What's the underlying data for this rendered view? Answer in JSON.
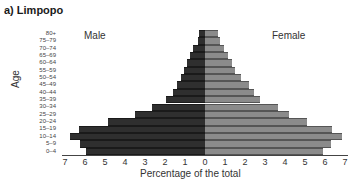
{
  "chart_data": {
    "type": "bar",
    "subtype": "population-pyramid",
    "title": "a) Limpopo",
    "xlabel": "Percentage of the total",
    "ylabel": "Age",
    "xlim": [
      -7,
      7
    ],
    "xticks": [
      "7",
      "6",
      "5",
      "4",
      "3",
      "2",
      "1",
      "0",
      "1",
      "2",
      "3",
      "4",
      "5",
      "6",
      "7"
    ],
    "grid": false,
    "legend": "inline side labels (Male left, Female right)",
    "categories": [
      "80+",
      "75–79",
      "70–74",
      "65–69",
      "60–64",
      "55–59",
      "50–54",
      "45–49",
      "40–44",
      "35–39",
      "30–34",
      "25–29",
      "20–24",
      "15–19",
      "10–14",
      "5–9",
      "0–4"
    ],
    "series": [
      {
        "name": "Male",
        "color": "#2f2f2f",
        "values": [
          0.3,
          0.35,
          0.6,
          0.75,
          0.9,
          1.05,
          1.2,
          1.4,
          1.6,
          1.95,
          2.65,
          3.5,
          4.85,
          6.3,
          6.75,
          6.25,
          5.95
        ]
      },
      {
        "name": "Female",
        "color": "#8b8b8b",
        "values": [
          0.65,
          0.75,
          0.95,
          1.15,
          1.35,
          1.5,
          1.8,
          2.2,
          2.45,
          2.75,
          3.65,
          4.2,
          5.1,
          6.35,
          6.85,
          6.3,
          5.9
        ]
      }
    ]
  },
  "labels": {
    "title": "a) Limpopo",
    "male": "Male",
    "female": "Female",
    "ylabel": "Age",
    "xlabel": "Percentage of the total"
  }
}
